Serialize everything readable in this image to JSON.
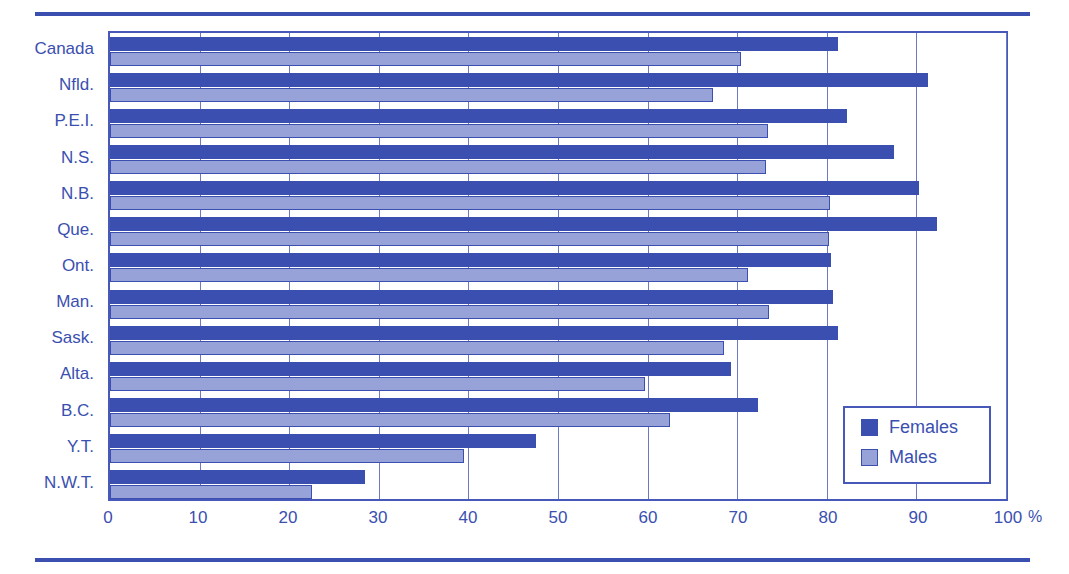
{
  "chart_data": {
    "type": "bar",
    "orientation": "horizontal",
    "title": "",
    "xlabel": "%",
    "ylabel": "",
    "xlim": [
      0,
      100
    ],
    "xticks": [
      0,
      10,
      20,
      30,
      40,
      50,
      60,
      70,
      80,
      90,
      100
    ],
    "xtick_labels": [
      "0",
      "10",
      "20",
      "30",
      "40",
      "50",
      "60",
      "70",
      "80",
      "90",
      "100"
    ],
    "x_unit_label": "%",
    "grid": "vertical",
    "legend_position": "inside-bottom-right",
    "categories": [
      "Canada",
      "Nfld.",
      "P.E.I.",
      "N.S.",
      "N.B.",
      "Que.",
      "Ont.",
      "Man.",
      "Sask.",
      "Alta.",
      "B.C.",
      "Y.T.",
      "N.W.T."
    ],
    "series": [
      {
        "name": "Females",
        "color": "#3b4fb0",
        "values": [
          81.2,
          91.3,
          82.3,
          87.5,
          90.3,
          92.3,
          80.5,
          80.7,
          81.2,
          69.3,
          72.3,
          47.5,
          28.5
        ]
      },
      {
        "name": "Males",
        "color": "#97a3d8",
        "values": [
          70.4,
          67.3,
          73.4,
          73.2,
          80.4,
          80.3,
          71.2,
          73.5,
          68.5,
          59.7,
          62.5,
          39.5,
          22.5
        ]
      }
    ]
  },
  "legend": {
    "entries": [
      {
        "label": "Females",
        "color": "#3b4fb0"
      },
      {
        "label": "Males",
        "color": "#97a3d8"
      }
    ]
  },
  "colors": {
    "females": "#3b4fb0",
    "males": "#97a3d8",
    "frame": "#4758b8",
    "gridline": "#6b7ac4",
    "rule": "#3b4fb0",
    "text": "#3b4fb0"
  }
}
